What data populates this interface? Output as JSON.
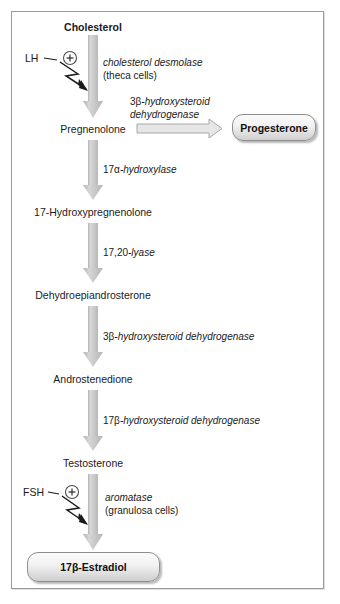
{
  "diagram": {
    "type": "flow-diagram",
    "colors": {
      "arrow_fill": "#c9c9c9",
      "arrow_edge": "#9a9a9a",
      "frame_border": "#9a9a9a",
      "text": "#1a1a1a",
      "box_border": "#8e8e8e"
    },
    "metabolites": [
      {
        "id": "cholesterol",
        "label": "Cholesterol",
        "bold": true
      },
      {
        "id": "pregnenolone",
        "label": "Pregnenolone",
        "bold": false
      },
      {
        "id": "hydroxypregnenolone",
        "label": "17-Hydroxypregnenolone",
        "bold": false
      },
      {
        "id": "dhea",
        "label": "Dehydroepiandrosterone",
        "bold": false
      },
      {
        "id": "androstenedione",
        "label": "Androstenedione",
        "bold": false
      },
      {
        "id": "testosterone",
        "label": "Testosterone",
        "bold": false
      }
    ],
    "products": [
      {
        "id": "progesterone",
        "label": "Progesterone"
      },
      {
        "id": "estradiol",
        "label_prefix": "17",
        "label_greek": "β",
        "label_suffix": "-Estradiol",
        "label": "17β-Estradiol"
      }
    ],
    "enzymes": [
      {
        "id": "cholesterol-desmolase",
        "line1_italic": "cholesterol desmolase",
        "line2_plain": "(theca cells)"
      },
      {
        "id": "hsd3b-progesterone",
        "line1_upright": "3β",
        "line1_italic": "-hydroxysteroid",
        "line2_italic": "dehydrogenase"
      },
      {
        "id": "hydroxylase-17a",
        "line1_upright": "17α",
        "line1_italic": "-hydroxylase"
      },
      {
        "id": "lyase-1720",
        "line1_upright": "17,20",
        "line1_italic": "-lyase"
      },
      {
        "id": "hsd3b-androstenedione",
        "line1_upright": "3β",
        "line1_italic": "-hydroxysteroid dehydrogenase"
      },
      {
        "id": "hsd17b",
        "line1_upright": "17β",
        "line1_italic": "-hydroxysteroid dehydrogenase"
      },
      {
        "id": "aromatase",
        "line1_italic": "aromatase",
        "line2_plain": "(granulosa cells)"
      }
    ],
    "stimulators": [
      {
        "id": "lh",
        "label": "LH",
        "sign": "+"
      },
      {
        "id": "fsh",
        "label": "FSH",
        "sign": "+"
      }
    ]
  }
}
